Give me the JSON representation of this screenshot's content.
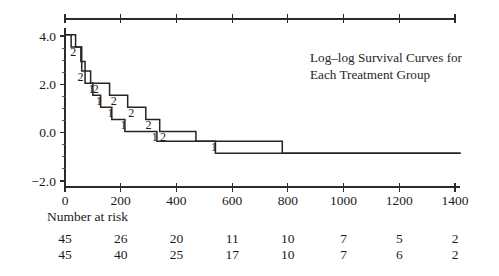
{
  "chart_data": {
    "type": "line",
    "title": "Log–log Survival Curves for Each Treatment Group",
    "title_line1": "Log–log Survival Curves for",
    "title_line2": "Each Treatment Group",
    "xlabel": "",
    "ylabel": "",
    "xlim": [
      -40,
      1450
    ],
    "ylim": [
      -2.6,
      4.6
    ],
    "xticks": [
      0,
      200,
      400,
      600,
      800,
      1000,
      1200,
      1400
    ],
    "xticklabels": [
      "0",
      "200",
      "400",
      "600",
      "800",
      "1000",
      "1200",
      "1400"
    ],
    "yticks": [
      -2.0,
      0.0,
      2.0,
      4.0
    ],
    "yticklabels": [
      "−2.0",
      "0.0",
      "2.0",
      "4.0"
    ],
    "yminorticks": [
      -1.5,
      -1.0,
      -0.5,
      0.5,
      1.0,
      1.5,
      2.5,
      3.0,
      3.5
    ],
    "grid": false,
    "legend": "inline-step-labels",
    "top_axis": true,
    "top_axis_range": [
      0,
      1400
    ],
    "series": [
      {
        "name": "1",
        "label": "1",
        "color": "#242424",
        "points": [
          [
            0,
            4.05
          ],
          [
            22,
            4.05
          ],
          [
            22,
            3.55
          ],
          [
            57,
            3.55
          ],
          [
            57,
            2.95
          ],
          [
            72,
            2.95
          ],
          [
            72,
            2.05
          ],
          [
            100,
            2.05
          ],
          [
            100,
            1.55
          ],
          [
            128,
            1.55
          ],
          [
            128,
            1.05
          ],
          [
            168,
            1.05
          ],
          [
            168,
            0.55
          ],
          [
            215,
            0.55
          ],
          [
            215,
            0.05
          ],
          [
            330,
            0.05
          ],
          [
            330,
            -0.35
          ],
          [
            540,
            -0.35
          ],
          [
            540,
            -0.85
          ],
          [
            1420,
            -0.85
          ]
        ],
        "markers": [
          {
            "x": 95,
            "y": 2.05,
            "text": "1"
          },
          {
            "x": 122,
            "y": 1.55,
            "text": "1"
          },
          {
            "x": 163,
            "y": 1.05,
            "text": "1"
          },
          {
            "x": 210,
            "y": 0.55,
            "text": "1"
          },
          {
            "x": 322,
            "y": 0.05,
            "text": "1"
          },
          {
            "x": 535,
            "y": -0.35,
            "text": "1"
          }
        ]
      },
      {
        "name": "2",
        "label": "2",
        "color": "#242424",
        "points": [
          [
            0,
            4.05
          ],
          [
            38,
            4.05
          ],
          [
            38,
            3.55
          ],
          [
            60,
            3.55
          ],
          [
            60,
            2.55
          ],
          [
            92,
            2.55
          ],
          [
            92,
            2.05
          ],
          [
            160,
            2.05
          ],
          [
            160,
            1.55
          ],
          [
            225,
            1.55
          ],
          [
            225,
            1.05
          ],
          [
            290,
            1.05
          ],
          [
            290,
            0.55
          ],
          [
            340,
            0.55
          ],
          [
            340,
            0.05
          ],
          [
            470,
            0.05
          ],
          [
            470,
            -0.35
          ],
          [
            780,
            -0.35
          ],
          [
            780,
            -0.85
          ],
          [
            1420,
            -0.85
          ]
        ],
        "markers": [
          {
            "x": 30,
            "y": 3.55,
            "text": "2"
          },
          {
            "x": 56,
            "y": 2.55,
            "text": "2"
          },
          {
            "x": 110,
            "y": 2.05,
            "text": "2"
          },
          {
            "x": 175,
            "y": 1.55,
            "text": "2"
          },
          {
            "x": 238,
            "y": 1.05,
            "text": "2"
          },
          {
            "x": 300,
            "y": 0.55,
            "text": "2"
          },
          {
            "x": 352,
            "y": 0.05,
            "text": "2"
          }
        ]
      }
    ]
  },
  "risk_table": {
    "heading": "Number at risk",
    "positions": [
      0,
      200,
      400,
      600,
      800,
      1000,
      1200,
      1400
    ],
    "rows": [
      {
        "group": "1",
        "values": [
          "45",
          "26",
          "20",
          "11",
          "10",
          "7",
          "5",
          "2"
        ]
      },
      {
        "group": "2",
        "values": [
          "45",
          "40",
          "25",
          "17",
          "10",
          "7",
          "6",
          "2"
        ]
      }
    ]
  }
}
